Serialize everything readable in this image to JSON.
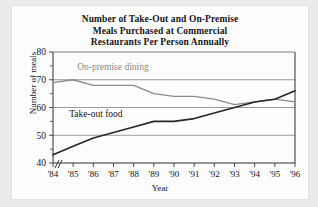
{
  "chart_data": {
    "type": "line",
    "title": "Number of Take-Out and On-Premise Meals Purchased at Commercial Restaurants Per Person Annually",
    "title_lines": [
      "Number of Take-Out and On-Premise",
      "Meals Purchased at Commercial",
      "Restaurants Per Person Annually"
    ],
    "xlabel": "Year",
    "ylabel": "Number of meals",
    "ylim": [
      40,
      80
    ],
    "yticks": [
      40,
      50,
      60,
      70,
      80
    ],
    "ytick_labels": [
      "40",
      "50",
      "60",
      "70",
      "80"
    ],
    "grid": true,
    "grid_axis": "y",
    "legend_position": "inline-annotations",
    "axis_break": "//",
    "categories": [
      "'84",
      "'85",
      "'86",
      "'87",
      "'88",
      "'89",
      "'90",
      "'91",
      "'92",
      "'93",
      "'94",
      "'95",
      "'96"
    ],
    "x": [
      1984,
      1985,
      1986,
      1987,
      1988,
      1989,
      1990,
      1991,
      1992,
      1993,
      1994,
      1995,
      1996
    ],
    "series": [
      {
        "name": "On-premise dining",
        "color": "#8a8a8a",
        "label_x": "'85",
        "values": [
          69,
          70,
          68,
          68,
          68,
          65,
          64,
          64,
          63,
          61,
          62,
          63,
          62
        ]
      },
      {
        "name": "Take-out food",
        "color": "#262626",
        "label_x": "'85",
        "values": [
          43,
          46,
          49,
          51,
          53,
          55,
          55,
          56,
          58,
          60,
          62,
          63,
          66
        ]
      }
    ],
    "annotations": [
      {
        "text": "On-premise dining",
        "color": "#8a8a8a"
      },
      {
        "text": "Take-out food",
        "color": "#15151c"
      }
    ]
  }
}
